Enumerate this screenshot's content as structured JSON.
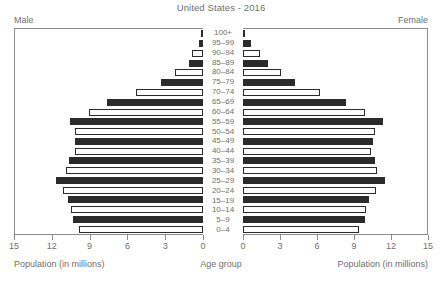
{
  "chart_data": {
    "type": "bar",
    "subtype": "population-pyramid",
    "title": "United States - 2016",
    "xlabel": "Population (in millions)",
    "ylabel": "Age group",
    "grid": false,
    "legend_position": "corners",
    "xlim": [
      0,
      15
    ],
    "xticks": [
      0,
      3,
      6,
      9,
      12,
      15
    ],
    "left_xticks": [
      15,
      12,
      9,
      6,
      3,
      0
    ],
    "right_xticks": [
      0,
      3,
      6,
      9,
      12,
      15
    ],
    "categories": [
      "100+",
      "95–99",
      "90–94",
      "85–89",
      "80–84",
      "75–79",
      "70–74",
      "65–69",
      "60–64",
      "55–59",
      "50–54",
      "45–49",
      "40–44",
      "35–39",
      "30–34",
      "25–29",
      "20–24",
      "15–19",
      "10–14",
      "5–9",
      "0–4"
    ],
    "series": [
      {
        "name": "Male",
        "side": "left",
        "values": [
          0.08,
          0.33,
          0.86,
          1.12,
          2.25,
          3.38,
          5.38,
          7.65,
          9.12,
          10.65,
          10.22,
          10.18,
          10.18,
          10.7,
          10.9,
          11.7,
          11.2,
          10.75,
          10.5,
          10.35,
          9.9
        ]
      },
      {
        "name": "Female",
        "side": "right",
        "values": [
          0.1,
          0.62,
          1.35,
          2.0,
          3.12,
          4.25,
          6.28,
          8.42,
          9.92,
          11.42,
          10.78,
          10.6,
          10.45,
          10.8,
          10.9,
          11.55,
          10.85,
          10.3,
          10.05,
          9.92,
          9.48
        ]
      }
    ],
    "colors": {
      "bar_dark": "#2b2b2b",
      "bar_light": "#fdfdfd",
      "bar_outline": "#2b2b2b",
      "axis": "#8c8c8c",
      "text": "#6f6f6f",
      "background": "#ffffff"
    }
  },
  "labels": {
    "male": "Male",
    "female": "Female",
    "caption_left": "Population (in millions)",
    "caption_center": "Age group",
    "caption_right": "Population (in millions)"
  }
}
